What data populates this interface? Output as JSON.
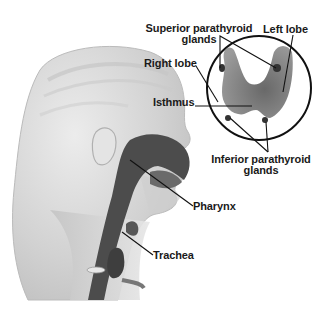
{
  "diagram": {
    "colors": {
      "background": "#ffffff",
      "head": "#d8d8d8",
      "head_shade": "#b5b5b5",
      "pharynx": "#4a4a4a",
      "gland": "#6a6a6a",
      "leader_line": "#111111",
      "label_text": "#1a1a1a"
    },
    "labels": {
      "superior_parathyroid_line1": "Superior parathyroid",
      "superior_parathyroid_line2": "glands",
      "left_lobe": "Left lobe",
      "right_lobe": "Right lobe",
      "isthmus": "Isthmus",
      "inferior_parathyroid_line1": "Inferior parathyroid",
      "inferior_parathyroid_line2": "glands",
      "pharynx": "Pharynx",
      "trachea": "Trachea"
    }
  }
}
